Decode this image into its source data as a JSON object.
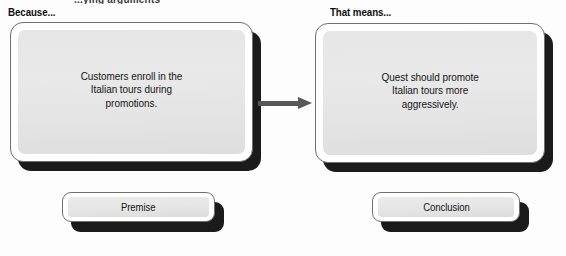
{
  "page": {
    "cut_off_header": "...ying arguments",
    "background_color": "#fdfdfd"
  },
  "diagram": {
    "type": "argument-flow",
    "accent_shadow_color": "#1b1b1b",
    "arrow_color": "#585858",
    "panel_fill_color": "#e6e6e6",
    "steps": [
      {
        "label": "Because...",
        "body": "Customers enroll in the\nItalian tours during\npromotions.",
        "tab": "Premise"
      },
      {
        "label": "That means...",
        "body": "Quest should promote\nItalian tours more\naggressively.",
        "tab": "Conclusion"
      }
    ],
    "connector": {
      "icon": "arrow-right-icon",
      "direction": "left-to-right"
    }
  }
}
